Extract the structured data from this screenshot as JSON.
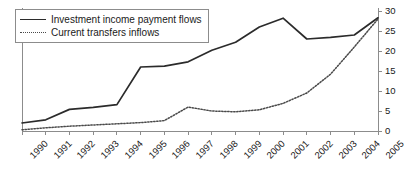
{
  "chart_data": {
    "type": "line",
    "title": "",
    "xlabel": "",
    "ylabel": "",
    "grid": false,
    "legend_position": "top-left",
    "y_axis_side": "right",
    "ylim": [
      0,
      30
    ],
    "yticks": [
      0,
      5,
      10,
      15,
      20,
      25,
      30
    ],
    "ytick_labels": [
      "0",
      "5",
      "10",
      "15",
      "20",
      "25",
      "30"
    ],
    "categories": [
      "1990",
      "1991",
      "1992",
      "1993",
      "1994",
      "1995",
      "1996",
      "1997",
      "1998",
      "1999",
      "2000",
      "2001",
      "2002",
      "2003",
      "2004",
      "2005"
    ],
    "x": [
      1990,
      1991,
      1992,
      1993,
      1994,
      1995,
      1996,
      1997,
      1998,
      1999,
      2000,
      2001,
      2002,
      2003,
      2004,
      2005
    ],
    "series": [
      {
        "name": "Investment income payment flows",
        "style": "solid",
        "color": "#2b2b2b",
        "values": [
          2.0,
          2.8,
          5.4,
          5.9,
          6.6,
          16.0,
          16.2,
          17.3,
          20.2,
          22.2,
          26.0,
          28.2,
          23.0,
          23.4,
          24.0,
          28.3
        ]
      },
      {
        "name": "Current transfers inflows",
        "style": "dotted",
        "color": "#4a4a4a",
        "values": [
          0.3,
          0.8,
          1.2,
          1.5,
          1.8,
          2.1,
          2.6,
          6.0,
          5.0,
          4.8,
          5.3,
          6.9,
          9.5,
          14.2,
          21.0,
          28.0
        ]
      }
    ]
  },
  "legend": {
    "items": [
      {
        "label": "Investment income payment flows",
        "style": "solid"
      },
      {
        "label": "Current transfers inflows",
        "style": "dotted"
      }
    ]
  }
}
